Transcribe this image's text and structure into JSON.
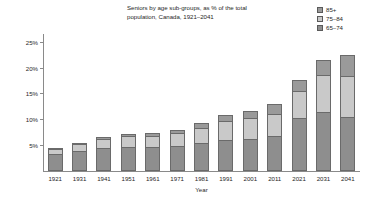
{
  "title": "Seniors by age sub-groups, as % of the total population, Canada, 1921–2041",
  "legend": {
    "position": "top-right",
    "entries": [
      {
        "label": "85+",
        "color": "#9a9a9a"
      },
      {
        "label": "75–84",
        "color": "#c9c9c9"
      },
      {
        "label": "65–74",
        "color": "#8e8e8e"
      }
    ]
  },
  "axes": {
    "ylabel": "",
    "xlabel": "Year",
    "yticks": [
      "5%",
      "10%",
      "15%",
      "20%",
      "25%"
    ],
    "ytick_values": [
      5,
      10,
      15,
      20,
      25
    ],
    "ylim": [
      0,
      26.5
    ]
  },
  "chart_data": {
    "type": "bar",
    "stacked": true,
    "title": "Seniors by age sub-groups, as % of the total population, Canada, 1921–2041",
    "xlabel": "Year",
    "ylabel": "",
    "ylim": [
      0,
      26.5
    ],
    "grid": false,
    "legend_position": "top-right",
    "categories": [
      "1921",
      "1931",
      "1941",
      "1951",
      "1961",
      "1971",
      "1981",
      "1991",
      "2001",
      "2011",
      "2021",
      "2031",
      "2041"
    ],
    "series": [
      {
        "name": "65–74",
        "color": "#8e8e8e",
        "values": [
          3.2,
          3.9,
          4.5,
          4.6,
          4.6,
          4.9,
          5.4,
          6.0,
          6.1,
          6.7,
          10.2,
          11.4,
          10.4
        ]
      },
      {
        "name": "75–84",
        "color": "#c9c9c9",
        "values": [
          1.1,
          1.3,
          1.7,
          2.1,
          2.2,
          2.4,
          2.9,
          3.6,
          4.1,
          4.4,
          5.3,
          7.1,
          8.0
        ]
      },
      {
        "name": "85+",
        "color": "#9a9a9a",
        "values": [
          0.2,
          0.3,
          0.4,
          0.5,
          0.5,
          0.6,
          0.9,
          1.2,
          1.5,
          1.8,
          2.1,
          2.9,
          4.1
        ]
      }
    ],
    "totals": [
      4.5,
      5.5,
      6.6,
      7.2,
      7.3,
      7.9,
      9.2,
      10.8,
      11.7,
      12.9,
      17.6,
      21.4,
      22.5
    ]
  },
  "colors": {
    "axis": "#8a8a8a",
    "outline": "#6a6a6a",
    "text": "#262626",
    "background": "#ffffff"
  }
}
